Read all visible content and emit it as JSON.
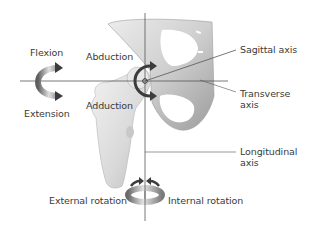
{
  "diagram": {
    "axes": {
      "sagittal": "Sagittal axis",
      "transverse_line1": "Transverse",
      "transverse_line2": "axis",
      "longitudinal_line1": "Longitudinal",
      "longitudinal_line2": "axis"
    },
    "movements": {
      "flexion": "Flexion",
      "extension": "Extension",
      "abduction": "Abduction",
      "adduction": "Adduction",
      "external_rotation": "External rotation",
      "internal_rotation": "Internal rotation"
    },
    "colors": {
      "background": "#ffffff",
      "text": "#3a3a3a",
      "axis_line": "#555555",
      "bone_light": "#e4e4e4",
      "bone_shade": "#b5b5b5",
      "arrow_dark": "#3c3c3c",
      "arrow_grad_light": "#d8d8d8",
      "arrow_grad_dark": "#6a6a6a"
    }
  }
}
